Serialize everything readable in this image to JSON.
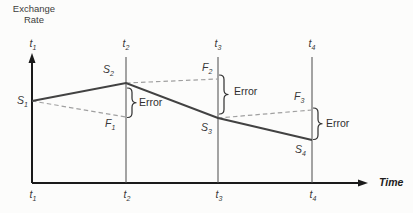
{
  "title": {
    "line1": "Exchange",
    "line2": "Rate"
  },
  "axis": {
    "time_label": "Time"
  },
  "labels": {
    "t_top": [
      {
        "base": "t",
        "sub": "1"
      },
      {
        "base": "t",
        "sub": "2"
      },
      {
        "base": "t",
        "sub": "3"
      },
      {
        "base": "t",
        "sub": "4"
      }
    ],
    "t_bottom": [
      {
        "base": "t",
        "sub": "1"
      },
      {
        "base": "t",
        "sub": "2"
      },
      {
        "base": "t",
        "sub": "3"
      },
      {
        "base": "t",
        "sub": "4"
      }
    ],
    "points": {
      "S1": {
        "base": "S",
        "sub": "1"
      },
      "S2": {
        "base": "S",
        "sub": "2"
      },
      "S3": {
        "base": "S",
        "sub": "3"
      },
      "S4": {
        "base": "S",
        "sub": "4"
      },
      "F1": {
        "base": "F",
        "sub": "1"
      },
      "F2": {
        "base": "F",
        "sub": "2"
      },
      "F3": {
        "base": "F",
        "sub": "3"
      }
    },
    "errors": [
      "Error",
      "Error",
      "Error"
    ]
  },
  "geometry": {
    "y_axis": {
      "x": 32,
      "top": 53,
      "bottom": 183
    },
    "x_axis": {
      "y": 183,
      "left": 32,
      "right": 368
    },
    "vline_top": 57,
    "vline_bottom": 183,
    "vlines": [
      {
        "x": 126
      },
      {
        "x": 218
      },
      {
        "x": 312
      }
    ],
    "spot_path": [
      [
        32,
        101
      ],
      [
        126,
        83
      ],
      [
        218,
        118
      ],
      [
        312,
        140
      ]
    ],
    "forecast_segments": [
      [
        [
          32,
          101
        ],
        [
          126,
          117
        ]
      ],
      [
        [
          126,
          83
        ],
        [
          218,
          79
        ]
      ],
      [
        [
          218,
          118
        ],
        [
          312,
          110
        ]
      ]
    ],
    "braces": [
      {
        "x": 127.5,
        "y1": 88,
        "y2": 117.5
      },
      {
        "x": 219.5,
        "y1": 75,
        "y2": 114
      },
      {
        "x": 313.5,
        "y1": 108,
        "y2": 139.5
      }
    ],
    "colors": {
      "axis": "#1a1a1a",
      "vline": "#4a4a4a",
      "spot": "#424242",
      "forecast": "#a0a0a0",
      "brace": "#2e2e2e"
    }
  },
  "chart_data": {
    "type": "line",
    "xlabel": "Time",
    "ylabel": "Exchange Rate",
    "x": [
      "t1",
      "t2",
      "t3",
      "t4"
    ],
    "note": "Conceptual diagram; values are relative levels (no numeric scale shown)",
    "series": [
      {
        "name": "Spot rate (solid)",
        "points": [
          "S1",
          "S2",
          "S3",
          "S4"
        ],
        "relative_levels": [
          82,
          100,
          65,
          43
        ]
      },
      {
        "name": "Forecast/forward rate (dashed)",
        "segments": [
          {
            "from": "S1 at t1",
            "to": "F1 at t2",
            "relative_level_at_end": 66
          },
          {
            "from": "S2 at t2",
            "to": "F2 at t3",
            "relative_level_at_end": 104
          },
          {
            "from": "S3 at t3",
            "to": "F3 at t4",
            "relative_level_at_end": 73
          }
        ]
      }
    ],
    "annotations": [
      {
        "label": "Error",
        "at": "t2",
        "between": [
          "S2",
          "F1"
        ]
      },
      {
        "label": "Error",
        "at": "t3",
        "between": [
          "F2",
          "S3"
        ]
      },
      {
        "label": "Error",
        "at": "t4",
        "between": [
          "F3",
          "S4"
        ]
      }
    ],
    "legend_position": "none",
    "grid": false
  }
}
